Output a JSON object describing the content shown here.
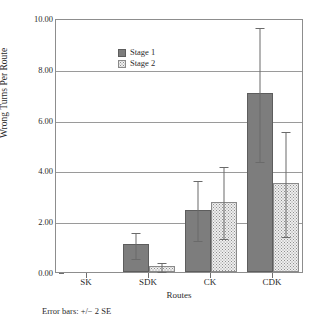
{
  "chart_data": {
    "type": "bar",
    "title": "",
    "subtitle": "",
    "xlabel": "Routes",
    "ylabel": "Wrong Turns Per Route",
    "categories": [
      "SK",
      "SDK",
      "CK",
      "CDK"
    ],
    "ylim": [
      0.0,
      10.0
    ],
    "ytick_labels": [
      "0.00",
      "2.00",
      "4.00",
      "6.00",
      "8.00",
      "10.00"
    ],
    "ytick_values": [
      0.0,
      2.0,
      4.0,
      6.0,
      8.0,
      10.0
    ],
    "grid": "horizontal",
    "legend_position": "top-left inside",
    "annotation": "Error bars: +/− 2 SE",
    "error_bar_definition": "+/− 2 SE",
    "series": [
      {
        "name": "Stage 1",
        "color": "#7d7d7d",
        "fill": "solid",
        "values": [
          0.0,
          1.1,
          2.45,
          7.05
        ],
        "error_low": [
          0.0,
          0.55,
          1.25,
          4.35
        ],
        "error_high": [
          0.0,
          1.6,
          3.65,
          9.7
        ]
      },
      {
        "name": "Stage 2",
        "color": "#eeeeee",
        "fill": "dotted",
        "values": [
          0.0,
          0.25,
          2.75,
          3.5
        ],
        "error_low": [
          0.0,
          0.05,
          1.35,
          1.4
        ],
        "error_high": [
          0.0,
          0.45,
          4.2,
          5.6
        ]
      }
    ]
  },
  "legend": {
    "items": [
      {
        "label": "Stage 1"
      },
      {
        "label": "Stage 2"
      }
    ]
  },
  "axes": {
    "y_title": "Wrong Turns Per Route",
    "x_title": "Routes"
  },
  "footnote": {
    "text": "Error bars: +/− 2 SE"
  }
}
